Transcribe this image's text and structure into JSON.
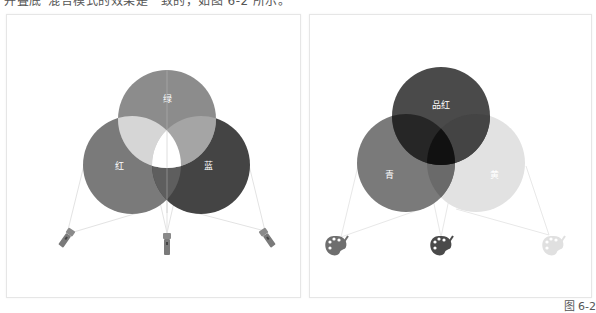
{
  "header": {
    "text": "并叠底“混合模式的效果是一致的，如图 6-2 所示。"
  },
  "additive": {
    "title": "additive-rgb-light-mixing",
    "circles": [
      {
        "label": "绿",
        "color": "#8c8c8c"
      },
      {
        "label": "红",
        "color": "#7a7a7a"
      },
      {
        "label": "蓝",
        "color": "#444444"
      }
    ],
    "overlap_center_color": "#ffffff",
    "sources": [
      "flashlight",
      "flashlight",
      "flashlight"
    ]
  },
  "subtractive": {
    "title": "subtractive-cmy-pigment-mixing",
    "circles": [
      {
        "label": "品红",
        "color": "#4a4a4a"
      },
      {
        "label": "青",
        "color": "#7a7a7a"
      },
      {
        "label": "黄",
        "color": "#e2e2e2"
      }
    ],
    "overlap_center_color": "#111111",
    "sources": [
      "palette",
      "palette",
      "palette"
    ]
  },
  "caption": "图 6-2"
}
